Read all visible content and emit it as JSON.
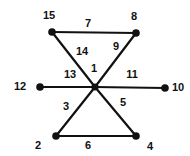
{
  "diagram": {
    "type": "graph",
    "colors": {
      "line": "#111111",
      "node": "#111111",
      "background": "#ffffff"
    },
    "nodes": [
      {
        "id": "center",
        "x": 95,
        "y": 87,
        "label": "1",
        "label_x": 94,
        "label_y": 69
      },
      {
        "id": "n15",
        "x": 52,
        "y": 32,
        "label": "15",
        "label_x": 49,
        "label_y": 16
      },
      {
        "id": "n8",
        "x": 136,
        "y": 33,
        "label": "8",
        "label_x": 134,
        "label_y": 17
      },
      {
        "id": "n12",
        "x": 40,
        "y": 87,
        "label": "12",
        "label_x": 20,
        "label_y": 87
      },
      {
        "id": "n10",
        "x": 165,
        "y": 88,
        "label": "10",
        "label_x": 178,
        "label_y": 88
      },
      {
        "id": "n2",
        "x": 56,
        "y": 136,
        "label": "2",
        "label_x": 38,
        "label_y": 146
      },
      {
        "id": "n4",
        "x": 136,
        "y": 136,
        "label": "4",
        "label_x": 150,
        "label_y": 147
      }
    ],
    "edges": [
      {
        "from": "n15",
        "to": "n8",
        "label": "7",
        "label_x": 88,
        "label_y": 24
      },
      {
        "from": "n15",
        "to": "center",
        "label": "14",
        "label_x": 82,
        "label_y": 52
      },
      {
        "from": "n8",
        "to": "center",
        "label": "9",
        "label_x": 116,
        "label_y": 47
      },
      {
        "from": "n12",
        "to": "center",
        "label": "13",
        "label_x": 70,
        "label_y": 75
      },
      {
        "from": "center",
        "to": "n10",
        "label": "11",
        "label_x": 132,
        "label_y": 75
      },
      {
        "from": "center",
        "to": "n2",
        "label": "3",
        "label_x": 66,
        "label_y": 107
      },
      {
        "from": "center",
        "to": "n4",
        "label": "5",
        "label_x": 123,
        "label_y": 103
      },
      {
        "from": "n2",
        "to": "n4",
        "label": "6",
        "label_x": 88,
        "label_y": 146
      }
    ]
  }
}
